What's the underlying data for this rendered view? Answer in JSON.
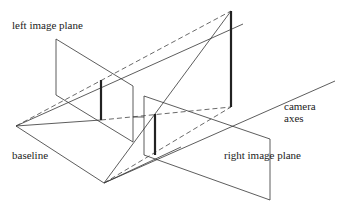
{
  "figure": {
    "labels": {
      "left_plane": "left image plane",
      "right_plane": "right image plane",
      "baseline": "baseline",
      "camera_axes_1": "camera",
      "camera_axes_2": "axes"
    },
    "colors": {
      "line": "#333333",
      "dashed": "#444444",
      "bold": "#222222"
    }
  }
}
